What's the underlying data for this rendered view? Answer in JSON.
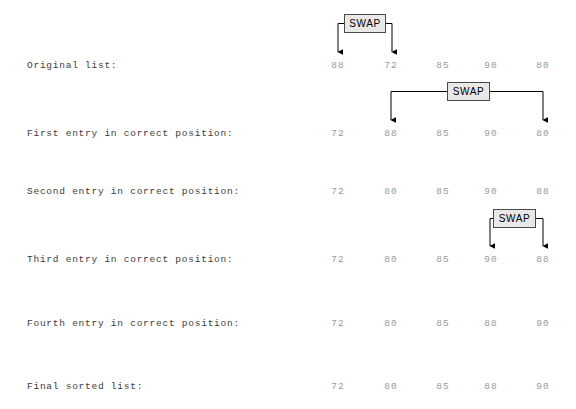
{
  "diagram": {
    "title_text": "",
    "swap_label": "SWAP",
    "columns_x": [
      338,
      391,
      443,
      491,
      543
    ],
    "label_color": "#3b3b3b",
    "value_color": "#9a9a9a",
    "swap_box_fill": "#e8e8e8",
    "swap_box_border": "#4a4a4a",
    "arrow_color": "#000000",
    "background": "#ffffff"
  },
  "rows": [
    {
      "label": "Original list:",
      "y": 65,
      "values": [
        "88",
        "72",
        "85",
        "90",
        "80"
      ]
    },
    {
      "label": "First entry in correct position:",
      "y": 133,
      "values": [
        "72",
        "88",
        "85",
        "90",
        "80"
      ]
    },
    {
      "label": "Second entry in correct position:",
      "y": 191,
      "values": [
        "72",
        "80",
        "85",
        "90",
        "88"
      ]
    },
    {
      "label": "Third entry in correct position:",
      "y": 259,
      "values": [
        "72",
        "80",
        "85",
        "90",
        "88"
      ]
    },
    {
      "label": "Fourth entry in correct position:",
      "y": 323,
      "values": [
        "72",
        "80",
        "85",
        "88",
        "90"
      ]
    },
    {
      "label": "Final sorted list:",
      "y": 386,
      "values": [
        "72",
        "80",
        "85",
        "88",
        "90"
      ]
    }
  ],
  "swaps": [
    {
      "label": "SWAP",
      "from_col": 0,
      "to_col": 1,
      "box": {
        "x": 344,
        "y": 14,
        "w": 42,
        "h": 19
      },
      "left_arrow_x": 338,
      "right_arrow_x": 392,
      "arrow_tip_y": 52,
      "target_row": 0
    },
    {
      "label": "SWAP",
      "from_col": 1,
      "to_col": 4,
      "box": {
        "x": 447,
        "y": 82,
        "w": 43,
        "h": 19
      },
      "left_arrow_x": 391,
      "right_arrow_x": 543,
      "arrow_tip_y": 120,
      "target_row": 1
    },
    {
      "label": "SWAP",
      "from_col": 3,
      "to_col": 4,
      "box": {
        "x": 493,
        "y": 209,
        "w": 43,
        "h": 19
      },
      "left_arrow_x": 490,
      "right_arrow_x": 543,
      "arrow_tip_y": 246,
      "target_row": 3
    }
  ]
}
